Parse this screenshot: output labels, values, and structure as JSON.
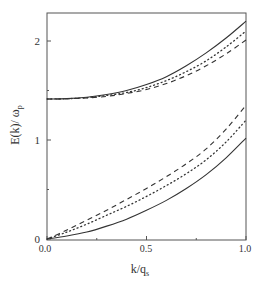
{
  "chart_data": {
    "type": "line",
    "title": "",
    "xlabel": "k/q_s",
    "xlabel_main": "k/q",
    "xlabel_sub": "s",
    "ylabel": "E(k)/ ω_p",
    "ylabel_main": "E(k)/ ω",
    "ylabel_sub": "p",
    "xlim": [
      0.0,
      1.0
    ],
    "ylim": [
      0,
      2.3
    ],
    "xticks": [
      0.0,
      0.5,
      1.0
    ],
    "xtick_labels": [
      "0.0",
      "0.5",
      "1.0"
    ],
    "yticks": [
      0,
      1,
      2
    ],
    "ytick_labels": [
      "0",
      "1",
      "2"
    ],
    "grid": false,
    "legend": "none",
    "x": [
      0.0,
      0.1,
      0.2,
      0.3,
      0.4,
      0.5,
      0.6,
      0.7,
      0.8,
      0.9,
      1.0
    ],
    "series": [
      {
        "name": "upper branch (solid)",
        "style": "solid",
        "values": [
          1.414,
          1.418,
          1.432,
          1.46,
          1.5,
          1.56,
          1.64,
          1.75,
          1.88,
          2.03,
          2.2
        ]
      },
      {
        "name": "upper branch (dotted)",
        "style": "dotted",
        "values": [
          1.414,
          1.417,
          1.428,
          1.45,
          1.48,
          1.53,
          1.6,
          1.69,
          1.8,
          1.94,
          2.1
        ]
      },
      {
        "name": "upper branch (dashed)",
        "style": "dashed",
        "values": [
          1.414,
          1.416,
          1.425,
          1.44,
          1.47,
          1.51,
          1.57,
          1.65,
          1.75,
          1.87,
          2.01
        ]
      },
      {
        "name": "lower branch (solid)",
        "style": "solid",
        "values": [
          0.0,
          0.03,
          0.07,
          0.13,
          0.2,
          0.29,
          0.39,
          0.51,
          0.65,
          0.82,
          1.02
        ]
      },
      {
        "name": "lower branch (dotted)",
        "style": "dotted",
        "values": [
          0.0,
          0.07,
          0.15,
          0.24,
          0.33,
          0.43,
          0.54,
          0.66,
          0.8,
          0.98,
          1.2
        ]
      },
      {
        "name": "lower branch (dashed)",
        "style": "dashed",
        "values": [
          0.0,
          0.09,
          0.19,
          0.29,
          0.4,
          0.51,
          0.63,
          0.76,
          0.91,
          1.11,
          1.35
        ]
      }
    ]
  },
  "colors": {
    "axis": "#555555",
    "line": "#333333"
  }
}
